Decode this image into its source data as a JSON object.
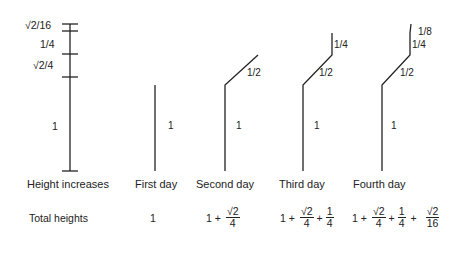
{
  "scale": {
    "labels": {
      "sqrt2_16": "√2/16",
      "quarter": "1/4",
      "sqrt2_4": "√2/4",
      "one": "1"
    }
  },
  "columns": [
    {
      "id": "height-increases",
      "caption": "Height increases",
      "total_label": "Total heights"
    },
    {
      "id": "first-day",
      "caption": "First day",
      "segments": [
        "1"
      ],
      "total": [
        "1"
      ]
    },
    {
      "id": "second-day",
      "caption": "Second day",
      "segments": [
        "1",
        "1/2"
      ]
    },
    {
      "id": "third-day",
      "caption": "Third day",
      "segments": [
        "1",
        "1/2",
        "1/4"
      ]
    },
    {
      "id": "fourth-day",
      "caption": "Fourth day",
      "segments": [
        "1",
        "1/2",
        "1/4",
        "1/8"
      ]
    }
  ],
  "totals": {
    "first": "1",
    "second": {
      "one": "1",
      "plus": "+",
      "f1_num": "√2",
      "f1_den": "4"
    },
    "third": {
      "one": "1",
      "plus1": "+",
      "f1_num": "√2",
      "f1_den": "4",
      "plus2": "+",
      "f2_num": "1",
      "f2_den": "4"
    },
    "fourth": {
      "one": "1",
      "plus1": "+",
      "f1_num": "√2",
      "f1_den": "4",
      "plus2": "+",
      "f2_num": "1",
      "f2_den": "4",
      "plus3": "+",
      "f3_num": "√2",
      "f3_den": "16"
    }
  },
  "colors": {
    "ink": "#222222",
    "background": "#ffffff"
  }
}
